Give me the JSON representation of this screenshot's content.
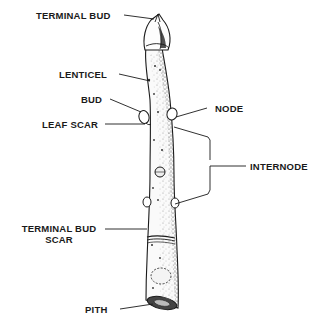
{
  "diagram": {
    "labels": {
      "terminal_bud": "TERMINAL BUD",
      "lenticel": "LENTICEL",
      "bud": "BUD",
      "leaf_scar": "LEAF SCAR",
      "node": "NODE",
      "internode": "INTERNODE",
      "terminal_bud_scar_line1": "TERMINAL BUD",
      "terminal_bud_scar_line2": "SCAR",
      "pith": "PITH"
    },
    "colors": {
      "ink": "#1a1a1a",
      "background": "#ffffff",
      "stipple": "#555555"
    }
  }
}
